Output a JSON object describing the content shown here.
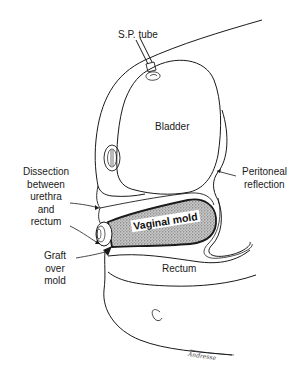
{
  "figure": {
    "type": "anatomical line illustration",
    "labels": {
      "sp_tube": "S.P. tube",
      "bladder": "Bladder",
      "peritoneal_line1": "Peritoneal",
      "peritoneal_line2": "reflection",
      "dissection_line1": "Dissection",
      "dissection_line2": "between",
      "dissection_line3": "urethra",
      "dissection_line4": "and",
      "dissection_line5": "rectum",
      "vaginal_mold": "Vaginal mold",
      "graft_line1": "Graft",
      "graft_line2": "over",
      "graft_line3": "mold",
      "rectum": "Rectum",
      "signature": "Andresse"
    },
    "colors": {
      "ink": "#1a1a1a",
      "mold_fill": "#9a9a9a",
      "background": "#ffffff"
    }
  }
}
